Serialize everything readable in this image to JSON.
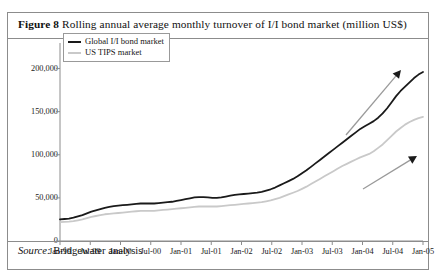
{
  "figure": {
    "label": "Figure 8",
    "caption": "Rolling annual average monthly turnover of I/I bond market (million US$)",
    "source_word": "Source:",
    "source_text": "Bridgewater analysis"
  },
  "colors": {
    "global_line": "#1a1a1a",
    "tips_line": "#c9c9c9",
    "frame": "#8c8c8c",
    "text": "#111111",
    "arrow": "#9a9a9a"
  },
  "chart_data": {
    "type": "line",
    "title": "Rolling annual average monthly turnover of I/I bond market (million US$)",
    "xlabel": "",
    "ylabel": "",
    "ylim": [
      0,
      225000
    ],
    "yticks": [
      0,
      50000,
      100000,
      150000,
      200000
    ],
    "ytick_labels": [
      "0",
      "50,000",
      "100,000",
      "150,000",
      "200,000"
    ],
    "grid": false,
    "legend_position": "top-left",
    "x": [
      "Jan-99",
      "Jul-99",
      "Jan-00",
      "Jul-00",
      "Jan-01",
      "Jul-01",
      "Jan-02",
      "Jul-02",
      "Jan-03",
      "Jul-03",
      "Jan-04",
      "Jul-04",
      "Jan-05"
    ],
    "xtick_labels": [
      "Jan-99",
      "Jul-99",
      "Jan-00",
      "Jul-00",
      "Jan-01",
      "Jul-01",
      "Jan-02",
      "Jul-02",
      "Jan-03",
      "Jul-03",
      "Jan-04",
      "Jul-04",
      "Jan-05"
    ],
    "series": [
      {
        "name": "Global I/I bond market",
        "color": "#1a1a1a",
        "monthly_values": [
          25000,
          25500,
          26000,
          27000,
          28500,
          30000,
          32000,
          34000,
          35500,
          37000,
          38500,
          39500,
          40500,
          41000,
          41500,
          42000,
          42500,
          43000,
          43500,
          43500,
          43500,
          43500,
          44000,
          44500,
          45000,
          45500,
          46500,
          47500,
          48500,
          49500,
          50500,
          51000,
          51000,
          50500,
          50000,
          50000,
          50500,
          51500,
          52500,
          53500,
          54000,
          54500,
          55000,
          55500,
          56000,
          57000,
          58500,
          60000,
          62000,
          64500,
          67000,
          69500,
          72000,
          75000,
          78500,
          82000,
          86000,
          90000,
          94000,
          98000,
          102000,
          106000,
          110000,
          114000,
          118000,
          122000,
          126000,
          130000,
          133000,
          136000,
          139000,
          143000,
          148000,
          154000,
          161000,
          168000,
          174000,
          179000,
          184000,
          189000,
          193000,
          196000
        ],
        "key_points": [
          {
            "x": "Jan-99",
            "y": 25000
          },
          {
            "x": "Jul-99",
            "y": 38500
          },
          {
            "x": "Jan-00",
            "y": 42500
          },
          {
            "x": "Jul-00",
            "y": 44000
          },
          {
            "x": "Jan-01",
            "y": 48500
          },
          {
            "x": "Jul-01",
            "y": 50000
          },
          {
            "x": "Jan-02",
            "y": 54000
          },
          {
            "x": "Jul-02",
            "y": 58500
          },
          {
            "x": "Jan-03",
            "y": 67000
          },
          {
            "x": "Jul-03",
            "y": 86000
          },
          {
            "x": "Jan-04",
            "y": 118000
          },
          {
            "x": "Jul-04",
            "y": 148000
          },
          {
            "x": "Jan-05",
            "y": 196000
          }
        ]
      },
      {
        "name": "US TIPS market",
        "color": "#c9c9c9",
        "monthly_values": [
          22000,
          22200,
          22500,
          23000,
          24000,
          25000,
          26500,
          28000,
          29000,
          30000,
          31000,
          31500,
          32000,
          32500,
          33000,
          33500,
          34000,
          34500,
          35000,
          35000,
          35000,
          35000,
          35500,
          36000,
          36500,
          37000,
          37500,
          38000,
          38500,
          39000,
          39500,
          40000,
          40000,
          40000,
          40000,
          40000,
          40500,
          41000,
          41500,
          42000,
          42500,
          43000,
          43500,
          44000,
          44500,
          45000,
          46000,
          47000,
          48500,
          50000,
          52000,
          54000,
          56000,
          58000,
          60500,
          63000,
          66000,
          69000,
          72000,
          75000,
          78000,
          81000,
          84000,
          87000,
          89500,
          92000,
          94500,
          97000,
          99000,
          101000,
          104000,
          108000,
          112000,
          117000,
          122000,
          127000,
          131000,
          135000,
          138000,
          140500,
          142500,
          144000
        ],
        "key_points": [
          {
            "x": "Jan-99",
            "y": 22000
          },
          {
            "x": "Jul-99",
            "y": 31000
          },
          {
            "x": "Jan-00",
            "y": 34000
          },
          {
            "x": "Jul-00",
            "y": 35500
          },
          {
            "x": "Jan-01",
            "y": 38500
          },
          {
            "x": "Jul-01",
            "y": 40000
          },
          {
            "x": "Jan-02",
            "y": 42500
          },
          {
            "x": "Jul-02",
            "y": 46000
          },
          {
            "x": "Jan-03",
            "y": 52000
          },
          {
            "x": "Jul-03",
            "y": 66000
          },
          {
            "x": "Jan-04",
            "y": 89500
          },
          {
            "x": "Jul-04",
            "y": 112000
          },
          {
            "x": "Jan-05",
            "y": 144000
          }
        ]
      }
    ],
    "annotations": [
      {
        "type": "arrow",
        "label": "growth-arrow-global",
        "from": [
          338,
          122
        ],
        "to": [
          393,
          57
        ]
      },
      {
        "type": "arrow",
        "label": "growth-arrow-tips",
        "from": [
          355,
          176
        ],
        "to": [
          409,
          143
        ]
      }
    ]
  },
  "legend": {
    "items": [
      {
        "label": "Global I/I bond market",
        "swatch": "dark"
      },
      {
        "label": "US TIPS market",
        "swatch": "light"
      }
    ]
  }
}
